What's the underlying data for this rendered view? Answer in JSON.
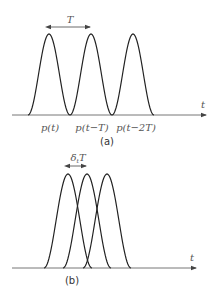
{
  "panel_a": {
    "caption": "(a)",
    "axis_label": "t",
    "period_label": "T",
    "pulse_labels": [
      "p(t)",
      "p(t−T)",
      "p(t−2T)"
    ],
    "pulse_peaks_x": [
      49,
      91,
      133
    ]
  },
  "panel_b": {
    "caption": "(b)",
    "axis_label": "t",
    "offset_label_base": "δ",
    "offset_label_sub": "t",
    "offset_label_tail": "T",
    "pulse_peaks_x": [
      68,
      87,
      107
    ]
  },
  "colors": {
    "curve": "#222222",
    "axis": "#555555",
    "text": "#555555"
  }
}
